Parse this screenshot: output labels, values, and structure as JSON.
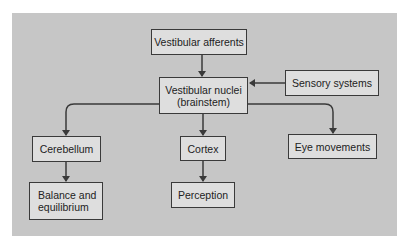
{
  "diagram": {
    "background_color": "#c6c6c6",
    "node_fill": "#dedede",
    "node_border": "#3a3a3a",
    "nodes": {
      "vestibular_afferents": "Vestibular afferents",
      "vestibular_nuclei": "Vestibular nuclei\n(brainstem)",
      "sensory_systems": "Sensory systems",
      "cerebellum": "Cerebellum",
      "cortex": "Cortex",
      "eye_movements": "Eye movements",
      "balance": "Balance and\nequilibrium",
      "perception": "Perception"
    },
    "edges": [
      {
        "from": "Vestibular afferents",
        "to": "Vestibular nuclei (brainstem)"
      },
      {
        "from": "Sensory systems",
        "to": "Vestibular nuclei (brainstem)"
      },
      {
        "from": "Vestibular nuclei (brainstem)",
        "to": "Cerebellum"
      },
      {
        "from": "Vestibular nuclei (brainstem)",
        "to": "Cortex"
      },
      {
        "from": "Vestibular nuclei (brainstem)",
        "to": "Eye movements"
      },
      {
        "from": "Cerebellum",
        "to": "Balance and equilibrium"
      },
      {
        "from": "Cortex",
        "to": "Perception"
      }
    ]
  }
}
